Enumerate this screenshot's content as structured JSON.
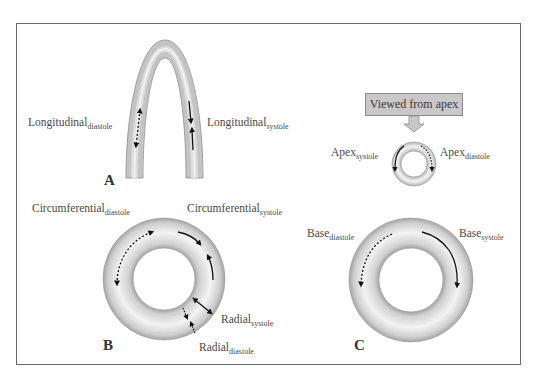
{
  "figure": {
    "panels": {
      "A": {
        "letter": "A",
        "labels": {
          "longitudinal_diastole": {
            "main": "Longitudinal",
            "sub": "diastole"
          },
          "longitudinal_systole": {
            "main": "Longitudinal",
            "sub": "systole"
          }
        }
      },
      "B": {
        "letter": "B",
        "labels": {
          "circumferential_diastole": {
            "main": "Circumferential",
            "sub": "diastole"
          },
          "circumferential_systole": {
            "main": "Circumferential",
            "sub": "systole"
          },
          "radial_systole": {
            "main": "Radial",
            "sub": "systole"
          },
          "radial_diastole": {
            "main": "Radial",
            "sub": "diastole"
          }
        }
      },
      "C": {
        "letter": "C",
        "viewed_from": "Viewed from apex",
        "labels": {
          "apex_systole": {
            "main": "Apex",
            "sub": "systole"
          },
          "apex_diastole": {
            "main": "Apex",
            "sub": "diastole"
          },
          "base_diastole": {
            "main": "Base",
            "sub": "diastole"
          },
          "base_systole": {
            "main": "Base",
            "sub": "systole"
          }
        }
      }
    },
    "colors": {
      "tissue_light": "#f2f2f2",
      "tissue_dark": "#a9a9a9",
      "arrow": "#111111",
      "frame": "#6a6a6a",
      "label_text": "#4a4a4a"
    }
  }
}
